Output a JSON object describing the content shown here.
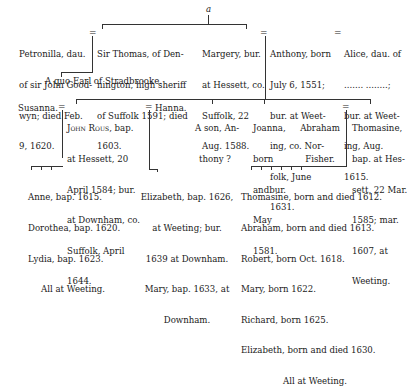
{
  "top_marker": "a",
  "generation1": {
    "petronilla": [
      "Petronilla, dau.",
      "of sir John Good-",
      "wyn; died Feb.",
      "9, 1620."
    ],
    "sir_thomas": [
      "Sir Thomas, of Den-",
      "nington, high sheriff",
      "of Suffolk 1591; died",
      "1603."
    ],
    "margery": [
      "Margery, bur.",
      "at Hessett, co.",
      "Suffolk, 22",
      "Aug. 1588."
    ],
    "anthony": [
      "Anthony, born",
      "July 6, 1551;",
      "bur. at Weet-",
      "ing, co. Nor-",
      "folk, June",
      "1631."
    ],
    "alice": [
      "Alice, dau. of",
      "....... ........;",
      "bur. at Weet-",
      "ing, Aug.",
      "1615."
    ],
    "stradbroke_note": "A quo Earl of Stradbrooke."
  },
  "generation2": {
    "susanna": "Susanna.",
    "john_rous_name": "John Rous",
    "john_rous": [
      ", bap.",
      "at Hessett, 20",
      "April 1584; bur.",
      "at Downham, co.",
      "Suffolk, April",
      "1644."
    ],
    "hanna": "Hanna.",
    "son_anthony": [
      "A son, An-",
      "thony ?"
    ],
    "joanna": [
      "Joanna,",
      "born",
      "andbur.",
      "May",
      "1581."
    ],
    "abraham_fisher": [
      "Abraham",
      "Fisher."
    ],
    "thomasine": [
      "Thomasine,",
      "bap. at Hes-",
      "sett, 22 Mar.",
      "1585; mar.",
      "1607, at",
      "Weeting."
    ]
  },
  "generation3": {
    "susanna_children": [
      "Anne, bap. 1615.",
      "Dorothea, bap. 1620.",
      "Lydia, bap. 1623.",
      "All at Weeting."
    ],
    "hanna_children": [
      "Elizabeth, bap. 1626,",
      "at Weeting; bur.",
      "1639 at Downham.",
      "Mary, bap. 1633, at",
      "Downham."
    ],
    "thomasine_children": [
      "Thomasine, born and died 1612.",
      "Abraham, born and died 1613.",
      "Robert, born Oct. 1618.",
      "Mary, born 1622.",
      "Richard, born 1625.",
      "Elizabeth, born and died 1630.",
      "All at Weeting."
    ]
  }
}
